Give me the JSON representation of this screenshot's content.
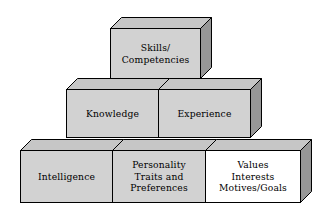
{
  "diagram": {
    "colors": {
      "front_gray": "#d2d2d2",
      "front_white": "#ffffff",
      "top_face": "#c6c6c6",
      "side_face": "#979797",
      "outline": "#000000",
      "text": "#000000",
      "background": "#ffffff"
    },
    "depth_x": 11,
    "depth_y": 11,
    "boxes": [
      {
        "id": "skills-competencies",
        "tier": "top",
        "front_fill": "#d2d2d2",
        "x": 110,
        "y": 28,
        "w": 90,
        "h": 50,
        "lines": [
          "Skills/",
          "Competencies"
        ]
      },
      {
        "id": "knowledge",
        "tier": "middle",
        "front_fill": "#d2d2d2",
        "x": 66,
        "y": 89,
        "w": 92,
        "h": 48,
        "lines": [
          "Knowledge"
        ]
      },
      {
        "id": "experience",
        "tier": "middle",
        "front_fill": "#d2d2d2",
        "x": 158,
        "y": 89,
        "w": 92,
        "h": 48,
        "lines": [
          "Experience"
        ]
      },
      {
        "id": "intelligence",
        "tier": "bottom",
        "front_fill": "#d2d2d2",
        "x": 20,
        "y": 150,
        "w": 92,
        "h": 52,
        "lines": [
          "Intelligence"
        ]
      },
      {
        "id": "personality-traits-preferences",
        "tier": "bottom",
        "front_fill": "#d2d2d2",
        "x": 112,
        "y": 150,
        "w": 93,
        "h": 52,
        "lines": [
          "Personality",
          "Traits and",
          "Preferences"
        ]
      },
      {
        "id": "values-interests-motives-goals",
        "tier": "bottom",
        "front_fill": "#ffffff",
        "x": 205,
        "y": 150,
        "w": 95,
        "h": 52,
        "lines": [
          "Values",
          "Interests",
          "Motives/Goals"
        ]
      }
    ]
  }
}
